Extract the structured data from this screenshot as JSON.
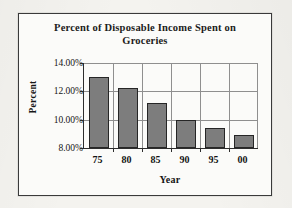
{
  "chart_data": {
    "type": "bar",
    "title": "Percent of Disposable Income Spent on Groceries",
    "title_lines": [
      "Percent of Disposable Income Spent on",
      "Groceries"
    ],
    "xlabel": "Year",
    "ylabel": "Percent",
    "categories": [
      "75",
      "80",
      "85",
      "90",
      "95",
      "00"
    ],
    "values": [
      13.0,
      12.25,
      11.15,
      10.0,
      9.4,
      8.9
    ],
    "ylim": [
      8.0,
      14.0
    ],
    "yticks": [
      8.0,
      10.0,
      12.0,
      14.0
    ],
    "ytick_labels": [
      "8.00%",
      "10.00%",
      "12.00%",
      "14.00%"
    ],
    "grid": true,
    "legend": false,
    "bar_color": "#7d7d7d",
    "bar_border_color": "#262626",
    "axis_color": "#2d2d2d",
    "grid_color": "#8f8f8f",
    "plot_background": "#fbfbf9",
    "frame_border_color": "#3a3a3a",
    "page_background": "#f3f2ee"
  }
}
